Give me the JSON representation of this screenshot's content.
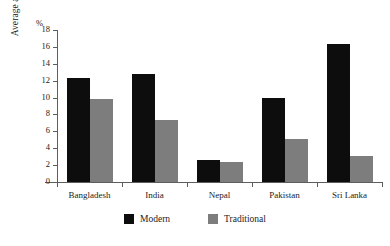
{
  "chart_data": {
    "type": "bar",
    "title": "",
    "xlabel": "",
    "ylabel": "Average annual growth",
    "unit_label": "%",
    "ylim": [
      0,
      18
    ],
    "ytick_step": 2,
    "yticks": [
      0,
      2,
      4,
      6,
      8,
      10,
      12,
      14,
      16,
      18
    ],
    "grid": false,
    "legend_position": "bottom",
    "categories": [
      "Bangladesh",
      "India",
      "Nepal",
      "Pakistan",
      "Sri Lanka"
    ],
    "series": [
      {
        "name": "Modern",
        "color": "#0d0d0d",
        "values": [
          12.3,
          12.8,
          2.6,
          9.9,
          16.4
        ]
      },
      {
        "name": "Traditional",
        "color": "#7d7d7d",
        "values": [
          9.8,
          7.4,
          2.4,
          5.1,
          3.1
        ]
      }
    ]
  },
  "legend": {
    "items": [
      {
        "label": "Modern",
        "swatch": "modern"
      },
      {
        "label": "Traditional",
        "swatch": "traditional"
      }
    ]
  }
}
